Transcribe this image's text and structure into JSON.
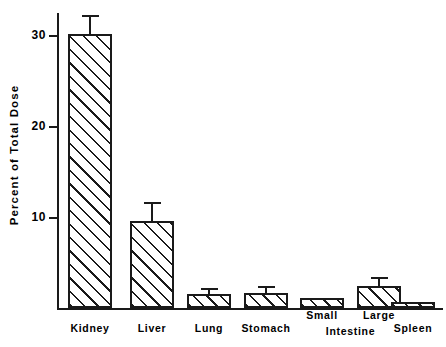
{
  "chart_data": {
    "type": "bar",
    "title": "",
    "subtitle": "",
    "xlabel": "",
    "ylabel": "Percent of Total Dose",
    "categories": [
      "Kidney",
      "Liver",
      "Lung",
      "Stomach",
      "Small Intestine",
      "Large Intestine",
      "Spleen"
    ],
    "values": [
      30.1,
      9.6,
      1.5,
      1.6,
      1.1,
      2.4,
      0.7
    ],
    "errors_upper": [
      32.2,
      11.6,
      2.2,
      2.4,
      1.1,
      3.4,
      0.7
    ],
    "series": [
      {
        "name": "Percent of Total Dose",
        "values": [
          30.1,
          9.6,
          1.5,
          1.6,
          1.1,
          2.4,
          0.7
        ]
      }
    ],
    "ylim": [
      0,
      33
    ],
    "yticks": [
      10,
      20,
      30
    ],
    "ytick_labels": [
      "10",
      "20",
      "30"
    ],
    "grid": false,
    "legend": false,
    "legend_position": "none",
    "bar_fill": "diagonal-hatch",
    "bar_edge_color": "#1a1a1a",
    "background_color": "#ffffff",
    "error_bar_style": "upper-whisker-only"
  },
  "axis": {
    "y_title": "Percent of Total Dose",
    "ticks": [
      {
        "label": "30",
        "value": 30
      },
      {
        "label": "20",
        "value": 20
      },
      {
        "label": "10",
        "value": 10
      }
    ]
  },
  "xaxis_labels": {
    "simple": [
      {
        "text": "Kidney",
        "index": 0
      },
      {
        "text": "Liver",
        "index": 1
      },
      {
        "text": "Lung",
        "index": 2
      },
      {
        "text": "Stomach",
        "index": 3
      },
      {
        "text": "Spleen",
        "index": 6
      }
    ],
    "stacked": {
      "upper_left": "Small",
      "upper_right": "Large",
      "lower_shared": "Intestine"
    }
  },
  "bars": [
    {
      "name": "Kidney",
      "value": 30.1,
      "error_top": 32.2,
      "has_error_bar": true
    },
    {
      "name": "Liver",
      "value": 9.6,
      "error_top": 11.6,
      "has_error_bar": true
    },
    {
      "name": "Lung",
      "value": 1.5,
      "error_top": 2.2,
      "has_error_bar": true
    },
    {
      "name": "Stomach",
      "value": 1.6,
      "error_top": 2.4,
      "has_error_bar": true
    },
    {
      "name": "Small Intestine",
      "value": 1.1,
      "error_top": 1.1,
      "has_error_bar": false
    },
    {
      "name": "Large Intestine",
      "value": 2.4,
      "error_top": 3.4,
      "has_error_bar": true
    },
    {
      "name": "Spleen",
      "value": 0.7,
      "error_top": 0.7,
      "has_error_bar": false
    }
  ]
}
